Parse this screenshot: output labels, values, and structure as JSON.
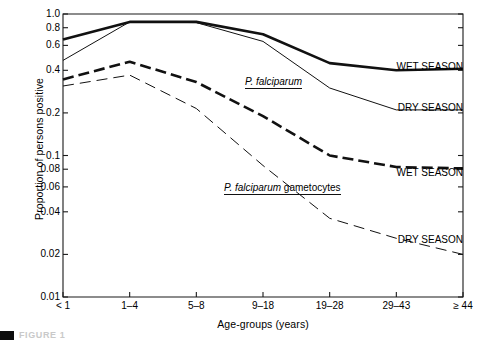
{
  "chart_data": {
    "type": "line",
    "title": "",
    "xlabel": "Age-groups (years)",
    "ylabel": "Proportion of persons positive",
    "yscale": "log",
    "ylim": [
      0.01,
      1.0
    ],
    "grid": false,
    "legend_position": "inline-right",
    "categories": [
      "< 1",
      "1–4",
      "5–8",
      "9–18",
      "19–28",
      "29–43",
      "≥ 44"
    ],
    "ytick_labels": [
      "1.0",
      "0.8",
      "0.6",
      "0.4",
      "0.2",
      "0.1",
      "0.08",
      "0.06",
      "0.04",
      "0.02",
      "0.01"
    ],
    "ytick_values": [
      1.0,
      0.8,
      0.6,
      0.4,
      0.2,
      0.1,
      0.08,
      0.06,
      0.04,
      0.02,
      0.01
    ],
    "series": [
      {
        "name": "P. falciparum WET SEASON",
        "group": "P. falciparum",
        "season": "WET SEASON",
        "style": "solid-thick",
        "values": [
          0.66,
          0.88,
          0.88,
          0.72,
          0.45,
          0.4,
          0.41
        ]
      },
      {
        "name": "P. falciparum DRY SEASON",
        "group": "P. falciparum",
        "season": "DRY SEASON",
        "style": "solid-thin",
        "values": [
          0.47,
          0.88,
          0.87,
          0.64,
          0.3,
          0.21,
          0.21
        ]
      },
      {
        "name": "P. falciparum gametocytes WET SEASON",
        "group": "P. falciparum gametocytes",
        "season": "WET SEASON",
        "style": "dashed-thick",
        "values": [
          0.345,
          0.46,
          0.33,
          0.19,
          0.1,
          0.083,
          0.081
        ]
      },
      {
        "name": "P. falciparum gametocytes DRY SEASON",
        "group": "P. falciparum gametocytes",
        "season": "DRY SEASON",
        "style": "dashed-thin",
        "values": [
          0.31,
          0.37,
          0.215,
          0.085,
          0.036,
          0.026,
          0.02
        ]
      }
    ],
    "annotations": [
      {
        "text": "WET SEASON",
        "for": "P. falciparum WET SEASON"
      },
      {
        "text": "DRY SEASON",
        "for": "P. falciparum DRY SEASON"
      },
      {
        "text": "WET SEASON",
        "for": "P. falciparum gametocytes WET SEASON"
      },
      {
        "text": "DRY SEASON",
        "for": "P. falciparum gametocytes DRY SEASON"
      },
      {
        "text": "P. falciparum",
        "italic_part": "P. falciparum",
        "plain_part": ""
      },
      {
        "text": "P. falciparum gametocytes",
        "italic_part": "P. falciparum",
        "plain_part": " gametocytes"
      }
    ]
  },
  "labels": {
    "ylabel": "Proportion of persons positive",
    "xlabel": "Age-groups (years)",
    "group_pf_italic": "P. falciparum",
    "group_pfg_italic": "P. falciparum",
    "group_pfg_plain": " gametocytes",
    "wet_season_top": "WET SEASON",
    "dry_season_top": "DRY SEASON",
    "wet_season_bottom": "WET SEASON",
    "dry_season_bottom": "DRY SEASON"
  },
  "caption": {
    "text": "FIGURE 1"
  }
}
